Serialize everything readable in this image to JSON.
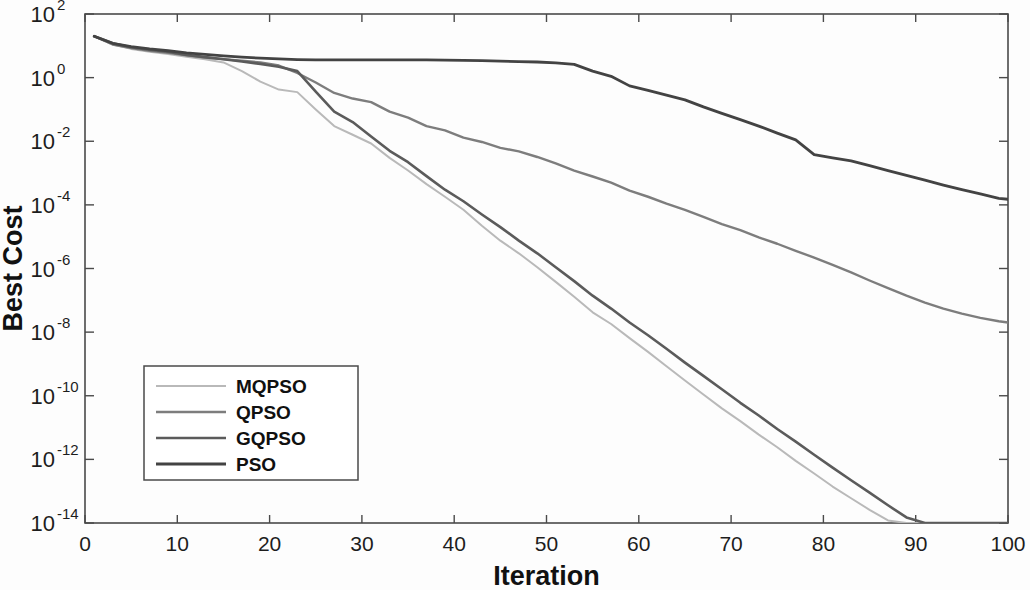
{
  "chart_data": {
    "type": "line",
    "title": "",
    "xlabel": "Iteration",
    "ylabel": "Best Cost",
    "xlim": [
      0,
      100
    ],
    "ylim": [
      1e-14,
      100
    ],
    "yscale": "log",
    "xscale": "linear",
    "grid": false,
    "legend_position": "lower-left",
    "xticks": [
      0,
      10,
      20,
      30,
      40,
      50,
      60,
      70,
      80,
      90,
      100
    ],
    "xtick_labels": [
      "0",
      "10",
      "20",
      "30",
      "40",
      "50",
      "60",
      "70",
      "80",
      "90",
      "100"
    ],
    "yticks": [
      100,
      1,
      0.01,
      0.0001,
      1e-06,
      1e-08,
      1e-10,
      1e-12,
      1e-14
    ],
    "ytick_labels": [
      "10^2",
      "10^0",
      "10^-2",
      "10^-4",
      "10^-6",
      "10^-8",
      "10^-10",
      "10^-12",
      "10^-14"
    ],
    "ytick_mantissa": [
      "10",
      "10",
      "10",
      "10",
      "10",
      "10",
      "10",
      "10",
      "10"
    ],
    "ytick_exponents": [
      "2",
      "0",
      "-2",
      "-4",
      "-6",
      "-8",
      "-10",
      "-12",
      "-14"
    ],
    "series": [
      {
        "name": "MQPSO",
        "color": "#b9b9b9",
        "width": 2.0,
        "x": [
          1,
          3,
          5,
          7,
          9,
          11,
          13,
          15,
          17,
          19,
          21,
          23,
          25,
          27,
          29,
          31,
          33,
          35,
          37,
          39,
          41,
          43,
          45,
          47,
          49,
          51,
          53,
          55,
          57,
          59,
          61,
          63,
          65,
          67,
          69,
          71,
          73,
          75,
          77,
          79,
          81,
          83,
          85,
          87,
          89,
          91,
          93,
          95,
          97,
          99,
          100
        ],
        "y": [
          20.0,
          11.0,
          8.0,
          6.5,
          5.5,
          4.5,
          3.8,
          3.0,
          1.6,
          0.75,
          0.42,
          0.35,
          0.1,
          0.03,
          0.016,
          0.0085,
          0.003,
          0.0012,
          0.00045,
          0.00018,
          7e-05,
          2.2e-05,
          7.5e-06,
          3e-06,
          1.1e-06,
          3.8e-07,
          1.3e-07,
          4.2e-08,
          1.8e-08,
          6.5e-09,
          2.4e-09,
          8.5e-10,
          3e-10,
          1.1e-10,
          4e-11,
          1.6e-11,
          6e-12,
          2.4e-12,
          9e-13,
          3.6e-13,
          1.4e-13,
          6e-14,
          2.6e-14,
          1.2e-14,
          5.5e-15,
          2.4e-15,
          1.1e-15,
          5e-16,
          2.4e-16,
          1.2e-16,
          8e-17
        ]
      },
      {
        "name": "QPSO",
        "color": "#7d7d7d",
        "width": 2.4,
        "x": [
          1,
          3,
          5,
          7,
          9,
          11,
          13,
          15,
          17,
          19,
          21,
          23,
          25,
          27,
          29,
          31,
          33,
          35,
          37,
          39,
          41,
          43,
          45,
          47,
          49,
          51,
          53,
          55,
          57,
          59,
          61,
          63,
          65,
          67,
          69,
          71,
          73,
          75,
          77,
          79,
          81,
          83,
          85,
          87,
          89,
          91,
          93,
          95,
          97,
          99,
          100
        ],
        "y": [
          20.0,
          11.0,
          8.5,
          7.0,
          6.0,
          5.0,
          4.3,
          3.8,
          3.4,
          3.0,
          2.4,
          1.4,
          0.7,
          0.33,
          0.22,
          0.17,
          0.085,
          0.055,
          0.03,
          0.022,
          0.013,
          0.0095,
          0.0062,
          0.0048,
          0.0032,
          0.002,
          0.0012,
          0.00078,
          0.0005,
          0.00028,
          0.00018,
          0.00011,
          7e-05,
          4.2e-05,
          2.5e-05,
          1.6e-05,
          9.5e-06,
          6e-06,
          3.6e-06,
          2.2e-06,
          1.3e-06,
          7.5e-07,
          4.2e-07,
          2.4e-07,
          1.4e-07,
          8.5e-08,
          5.5e-08,
          3.8e-08,
          2.8e-08,
          2.2e-08,
          2e-08
        ]
      },
      {
        "name": "GQPSO",
        "color": "#5b5b5b",
        "width": 2.6,
        "x": [
          1,
          3,
          5,
          7,
          9,
          11,
          13,
          15,
          17,
          19,
          21,
          23,
          25,
          27,
          29,
          31,
          33,
          35,
          37,
          39,
          41,
          43,
          45,
          47,
          49,
          51,
          53,
          55,
          57,
          59,
          61,
          63,
          65,
          67,
          69,
          71,
          73,
          75,
          77,
          79,
          81,
          83,
          85,
          87,
          89,
          91,
          93,
          95,
          97,
          99,
          100
        ],
        "y": [
          20.0,
          12.0,
          9.0,
          7.5,
          6.5,
          5.2,
          4.4,
          3.8,
          3.2,
          2.7,
          2.2,
          1.6,
          0.36,
          0.085,
          0.04,
          0.014,
          0.005,
          0.0022,
          0.0008,
          0.0003,
          0.00013,
          5e-05,
          2e-05,
          7.5e-06,
          3e-06,
          1.1e-06,
          4e-07,
          1.4e-07,
          5.5e-08,
          2e-08,
          8e-09,
          3e-09,
          1.1e-09,
          4.2e-10,
          1.6e-10,
          6e-11,
          2.4e-11,
          9e-12,
          3.6e-12,
          1.4e-12,
          5.5e-13,
          2.2e-13,
          9e-14,
          3.6e-14,
          1.5e-14,
          6.5e-15,
          3e-15,
          1.4e-15,
          7e-16,
          3.8e-16,
          3e-16
        ]
      },
      {
        "name": "PSO",
        "color": "#434343",
        "width": 2.8,
        "x": [
          1,
          3,
          5,
          7,
          9,
          11,
          13,
          15,
          17,
          19,
          21,
          23,
          25,
          27,
          29,
          31,
          33,
          35,
          37,
          39,
          41,
          43,
          45,
          47,
          49,
          51,
          53,
          55,
          57,
          59,
          61,
          63,
          65,
          67,
          69,
          71,
          73,
          75,
          77,
          79,
          81,
          83,
          85,
          87,
          89,
          91,
          93,
          95,
          97,
          99,
          100
        ],
        "y": [
          20.0,
          12.0,
          9.5,
          8.0,
          7.0,
          6.0,
          5.4,
          4.8,
          4.4,
          4.1,
          3.9,
          3.7,
          3.6,
          3.6,
          3.6,
          3.6,
          3.6,
          3.6,
          3.6,
          3.55,
          3.5,
          3.4,
          3.3,
          3.2,
          3.1,
          2.9,
          2.6,
          1.6,
          1.1,
          0.55,
          0.4,
          0.28,
          0.2,
          0.12,
          0.075,
          0.048,
          0.03,
          0.018,
          0.011,
          0.0038,
          0.003,
          0.0024,
          0.0017,
          0.0012,
          0.00085,
          0.0006,
          0.00042,
          0.0003,
          0.00022,
          0.00016,
          0.00015
        ]
      }
    ]
  },
  "legend": {
    "entries": [
      {
        "label": "MQPSO"
      },
      {
        "label": "QPSO"
      },
      {
        "label": "GQPSO"
      },
      {
        "label": "PSO"
      }
    ]
  }
}
